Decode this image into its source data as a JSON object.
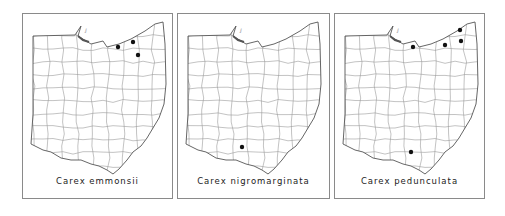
{
  "figure": {
    "state": "Ohio",
    "panels": [
      {
        "species": "Carex emmonsii",
        "left": 22,
        "width": 151,
        "records": [
          {
            "x": 95,
            "y": 33
          },
          {
            "x": 110,
            "y": 28
          },
          {
            "x": 115,
            "y": 41
          }
        ]
      },
      {
        "species": "Carex nigromarginata",
        "left": 177,
        "width": 153,
        "records": [
          {
            "x": 64,
            "y": 133
          }
        ]
      },
      {
        "species": "Carex pedunculata",
        "left": 334,
        "width": 151,
        "records": [
          {
            "x": 78,
            "y": 33
          },
          {
            "x": 110,
            "y": 31
          },
          {
            "x": 125,
            "y": 16
          },
          {
            "x": 126,
            "y": 27
          },
          {
            "x": 76,
            "y": 138
          }
        ]
      }
    ],
    "colors": {
      "outline": "#555555",
      "county_lines": "#9a9a9a",
      "dot": "#111111",
      "frame": "#8a8a8a"
    }
  }
}
